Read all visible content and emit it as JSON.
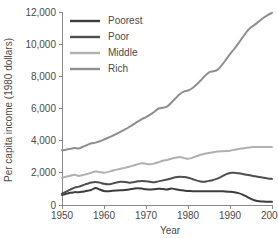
{
  "chart_data": {
    "type": "line",
    "title": "",
    "xlabel": "Year",
    "ylabel": "Per capita income (1980 dollars)",
    "xlim": [
      1950,
      2000
    ],
    "ylim": [
      0,
      12000
    ],
    "grid": false,
    "legend_position": "top-left",
    "xticks": [
      1950,
      1960,
      1970,
      1980,
      1990,
      2000
    ],
    "xtick_labels": [
      "1950",
      "1960",
      "1970",
      "1980",
      "1990",
      "2000"
    ],
    "yticks": [
      0,
      2000,
      4000,
      6000,
      8000,
      10000,
      12000
    ],
    "ytick_labels": [
      "0",
      "2,000",
      "4,000",
      "6,000",
      "8,000",
      "10,000",
      "12,000"
    ],
    "x": [
      1950,
      1951,
      1952,
      1953,
      1954,
      1955,
      1956,
      1957,
      1958,
      1959,
      1960,
      1961,
      1962,
      1963,
      1964,
      1965,
      1966,
      1967,
      1968,
      1969,
      1970,
      1971,
      1972,
      1973,
      1974,
      1975,
      1976,
      1977,
      1978,
      1979,
      1980,
      1981,
      1982,
      1983,
      1984,
      1985,
      1986,
      1987,
      1988,
      1989,
      1990,
      1991,
      1992,
      1993,
      1994,
      1995,
      1996,
      1997,
      1998,
      1999,
      2000
    ],
    "series": [
      {
        "name": "Poorest",
        "color": "#3c3c3c",
        "values": [
          620,
          700,
          760,
          800,
          790,
          830,
          880,
          940,
          1060,
          960,
          870,
          860,
          880,
          900,
          920,
          940,
          970,
          1010,
          1040,
          1020,
          980,
          960,
          980,
          1010,
          1000,
          960,
          1030,
          980,
          930,
          900,
          870,
          860,
          850,
          850,
          850,
          860,
          860,
          860,
          850,
          840,
          820,
          790,
          740,
          650,
          520,
          380,
          280,
          230,
          210,
          205,
          200
        ]
      },
      {
        "name": "Poor",
        "color": "#4f4f4f",
        "values": [
          700,
          830,
          960,
          1080,
          1140,
          1230,
          1320,
          1400,
          1430,
          1390,
          1320,
          1290,
          1330,
          1400,
          1440,
          1430,
          1390,
          1410,
          1470,
          1500,
          1480,
          1440,
          1420,
          1470,
          1530,
          1580,
          1650,
          1720,
          1760,
          1740,
          1700,
          1620,
          1530,
          1460,
          1450,
          1500,
          1560,
          1640,
          1760,
          1900,
          1990,
          2000,
          1970,
          1930,
          1880,
          1830,
          1790,
          1740,
          1690,
          1650,
          1620
        ]
      },
      {
        "name": "Middle",
        "color": "#b0b0b0",
        "values": [
          1700,
          1760,
          1820,
          1880,
          1810,
          1870,
          1930,
          2010,
          2090,
          2040,
          2010,
          2060,
          2130,
          2200,
          2260,
          2310,
          2380,
          2450,
          2530,
          2600,
          2560,
          2530,
          2580,
          2660,
          2750,
          2800,
          2880,
          2940,
          2990,
          2930,
          2870,
          2930,
          3030,
          3120,
          3180,
          3230,
          3280,
          3320,
          3340,
          3350,
          3380,
          3430,
          3480,
          3520,
          3560,
          3590,
          3600,
          3600,
          3600,
          3600,
          3600
        ]
      },
      {
        "name": "Rich",
        "color": "#8f8f8f",
        "values": [
          3400,
          3440,
          3490,
          3540,
          3520,
          3620,
          3740,
          3840,
          3880,
          3960,
          4070,
          4180,
          4300,
          4420,
          4560,
          4700,
          4850,
          5010,
          5180,
          5340,
          5470,
          5620,
          5800,
          6000,
          6050,
          6120,
          6360,
          6620,
          6880,
          7050,
          7120,
          7260,
          7480,
          7740,
          8020,
          8250,
          8320,
          8400,
          8680,
          9020,
          9380,
          9700,
          10050,
          10420,
          10780,
          11050,
          11230,
          11440,
          11640,
          11810,
          11950
        ]
      }
    ]
  },
  "legend": {
    "entries": [
      {
        "label": "Poorest"
      },
      {
        "label": "Poor"
      },
      {
        "label": "Middle"
      },
      {
        "label": "Rich"
      }
    ]
  }
}
